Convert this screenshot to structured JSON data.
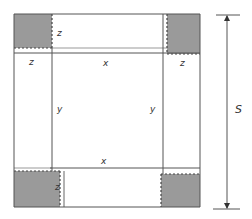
{
  "diagram": {
    "colors": {
      "line": "#555555",
      "corner_fill": "#9a9a9a",
      "background": "#ffffff"
    },
    "labels": {
      "top_flap_z": "z",
      "left_flap_z": "z",
      "top_x": "x",
      "right_flap_z": "z",
      "left_y": "y",
      "right_y": "y",
      "bottom_x": "x",
      "bottom_flap_z": "z",
      "side_length": "S"
    },
    "corners": [
      {
        "name": "top-left",
        "shaded": true
      },
      {
        "name": "top-right",
        "shaded": true
      },
      {
        "name": "bottom-left",
        "shaded": true
      },
      {
        "name": "bottom-right",
        "shaded": true
      }
    ],
    "dimension": {
      "label": "S",
      "direction": "vertical",
      "arrows": "both"
    }
  }
}
